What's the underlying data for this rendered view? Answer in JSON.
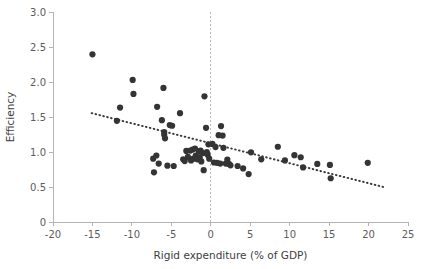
{
  "chart_data": {
    "type": "scatter",
    "title": "",
    "xlabel": "Rigid expenditure (% of GDP)",
    "ylabel": "Efficiency",
    "xlim": [
      -20,
      25
    ],
    "ylim": [
      0,
      3.0
    ],
    "xticks": [
      -20,
      -15,
      -10,
      -5,
      0,
      5,
      10,
      15,
      20,
      25
    ],
    "xtick_labels": [
      "-20",
      "-15",
      "-10",
      "-5",
      "0",
      "5",
      "10",
      "15",
      "20",
      "25"
    ],
    "yticks": [
      0,
      0.5,
      1.0,
      1.5,
      2.0,
      2.5,
      3.0
    ],
    "ytick_labels": [
      "0",
      "0.5",
      "1.0",
      "1.5",
      "2.0",
      "2.5",
      "3.0"
    ],
    "grid": false,
    "legend": "none",
    "marker_color": "#343434",
    "marker_radius": 3.1,
    "reference_lines": [
      {
        "name": "zero-vertical-reference",
        "orientation": "vertical",
        "value": 0,
        "style": "dashed",
        "color": "#b9b9b9"
      }
    ],
    "trend_line": {
      "name": "fitted-trend",
      "style": "dotted",
      "color": "#3a3a3a",
      "x_start": -15.1,
      "y_start": 1.555,
      "x_end": 21.9,
      "y_end": 0.5
    },
    "points": [
      [
        -15.0,
        2.395
      ],
      [
        -11.9,
        1.445
      ],
      [
        -11.5,
        1.635
      ],
      [
        -9.9,
        2.03
      ],
      [
        -9.8,
        1.83
      ],
      [
        -7.3,
        0.905
      ],
      [
        -7.2,
        0.71
      ],
      [
        -6.9,
        0.95
      ],
      [
        -6.8,
        1.645
      ],
      [
        -6.6,
        0.835
      ],
      [
        -6.2,
        1.455
      ],
      [
        -6.0,
        1.915
      ],
      [
        -5.9,
        1.285
      ],
      [
        -5.9,
        1.245
      ],
      [
        -5.8,
        1.195
      ],
      [
        -5.2,
        1.385
      ],
      [
        -4.9,
        1.375
      ],
      [
        -4.7,
        0.8
      ],
      [
        -5.5,
        0.805
      ],
      [
        -3.9,
        1.555
      ],
      [
        -3.5,
        0.895
      ],
      [
        -3.3,
        0.87
      ],
      [
        -3.1,
        1.015
      ],
      [
        -2.9,
        0.93
      ],
      [
        -2.6,
        1.02
      ],
      [
        -2.5,
        0.88
      ],
      [
        -2.3,
        1.035
      ],
      [
        -2.2,
        0.905
      ],
      [
        -2.0,
        1.05
      ],
      [
        -1.9,
        0.95
      ],
      [
        -1.7,
        0.895
      ],
      [
        -1.5,
        1.005
      ],
      [
        -1.4,
        0.92
      ],
      [
        -1.3,
        1.02
      ],
      [
        -1.2,
        0.865
      ],
      [
        -1.0,
        0.985
      ],
      [
        -0.9,
        0.74
      ],
      [
        -0.8,
        1.795
      ],
      [
        -0.6,
        1.345
      ],
      [
        -0.5,
        1.0
      ],
      [
        -0.4,
        0.96
      ],
      [
        -0.3,
        1.11
      ],
      [
        -0.2,
        0.905
      ],
      [
        0.2,
        1.115
      ],
      [
        0.4,
        0.85
      ],
      [
        0.6,
        1.07
      ],
      [
        0.8,
        0.845
      ],
      [
        1.0,
        1.24
      ],
      [
        1.2,
        0.835
      ],
      [
        1.3,
        1.37
      ],
      [
        1.5,
        1.235
      ],
      [
        1.6,
        1.06
      ],
      [
        1.9,
        0.835
      ],
      [
        2.1,
        0.89
      ],
      [
        2.3,
        0.83
      ],
      [
        2.5,
        0.81
      ],
      [
        3.4,
        0.8
      ],
      [
        4.1,
        0.765
      ],
      [
        4.8,
        0.685
      ],
      [
        5.1,
        0.995
      ],
      [
        6.4,
        0.895
      ],
      [
        8.5,
        1.075
      ],
      [
        9.4,
        0.88
      ],
      [
        10.6,
        0.955
      ],
      [
        11.4,
        0.925
      ],
      [
        11.7,
        0.78
      ],
      [
        13.5,
        0.83
      ],
      [
        15.1,
        0.815
      ],
      [
        15.2,
        0.625
      ],
      [
        19.9,
        0.845
      ]
    ]
  }
}
